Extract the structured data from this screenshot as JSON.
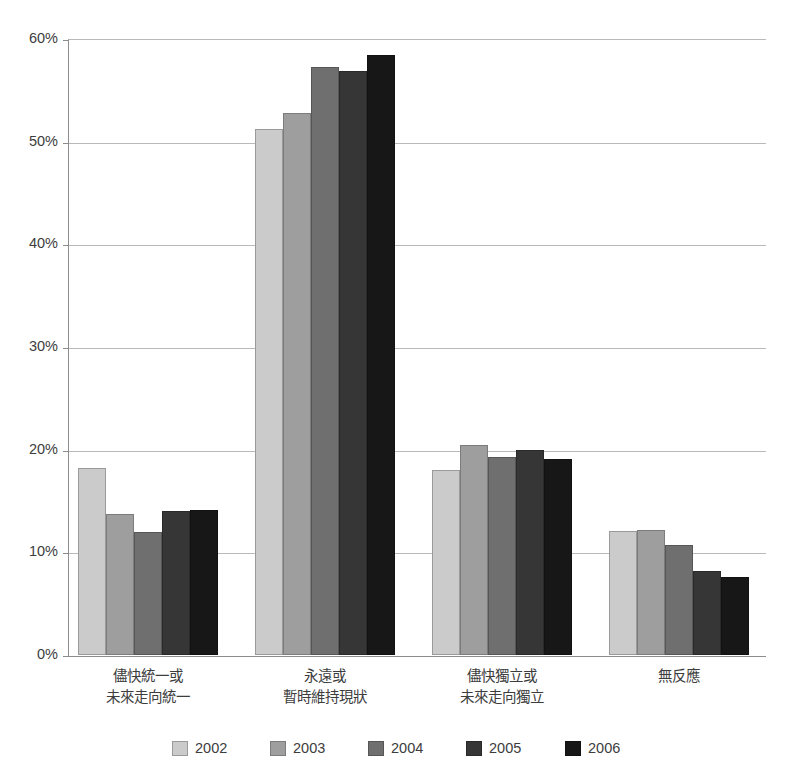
{
  "chart_data": {
    "type": "bar",
    "title": "",
    "xlabel": "",
    "ylabel": "",
    "ylim": [
      0,
      60
    ],
    "ytick_labels": [
      "60%",
      "50%",
      "40%",
      "30%",
      "20%",
      "10%",
      "0%"
    ],
    "ytick_values": [
      60,
      50,
      40,
      30,
      20,
      10,
      0
    ],
    "yunit": "%",
    "grid": true,
    "legend_position": "bottom",
    "categories": [
      "儘快統一或\n未來走向統一",
      "永遠或\n暫時維持現狀",
      "儘快獨立或\n未來走向獨立",
      "無反應"
    ],
    "category_lines": [
      [
        "儘快統一或",
        "未來走向統一"
      ],
      [
        "永遠或",
        "暫時維持現狀"
      ],
      [
        "儘快獨立或",
        "未來走向獨立"
      ],
      [
        "無反應",
        ""
      ]
    ],
    "series": [
      {
        "name": "2002",
        "color": "#cbcbcb",
        "values": [
          18.2,
          51.2,
          18.0,
          12.1
        ]
      },
      {
        "name": "2003",
        "color": "#9e9e9e",
        "values": [
          13.7,
          52.8,
          20.5,
          12.2
        ]
      },
      {
        "name": "2004",
        "color": "#6f6f6f",
        "values": [
          12.0,
          57.3,
          19.3,
          10.7
        ]
      },
      {
        "name": "2005",
        "color": "#363636",
        "values": [
          14.0,
          56.9,
          20.0,
          8.2
        ]
      },
      {
        "name": "2006",
        "color": "#171717",
        "values": [
          14.1,
          58.4,
          19.1,
          7.6
        ]
      }
    ]
  },
  "legend": {
    "entries": [
      "2002",
      "2003",
      "2004",
      "2005",
      "2006"
    ]
  },
  "colors": {
    "background": "#ffffff",
    "axis": "#8c8c8c",
    "grid": "#b9b9b9",
    "text": "#3d3d3d"
  }
}
